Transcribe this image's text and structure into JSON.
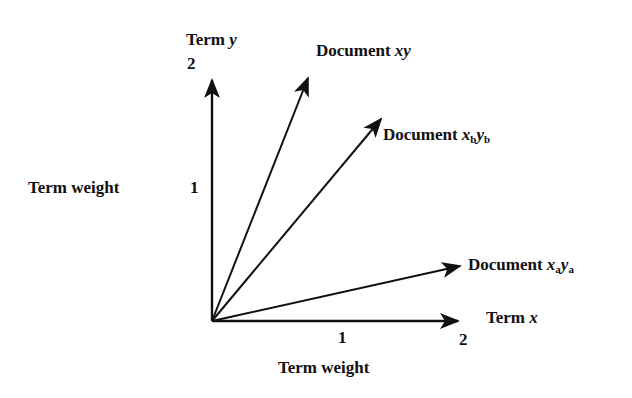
{
  "diagram": {
    "axes": {
      "y": {
        "name_prefix": "Term ",
        "name_var": "y",
        "tick_1": "1",
        "tick_2": "2",
        "label": "Term weight"
      },
      "x": {
        "name_prefix": "Term ",
        "name_var": "x",
        "tick_1": "1",
        "tick_2": "2",
        "label": "Term weight"
      }
    },
    "vectors": [
      {
        "prefix": "Document ",
        "var1": "x",
        "sub1": "",
        "var2": "y",
        "sub2": "",
        "approx_x": 0.8,
        "approx_y": 2.0
      },
      {
        "prefix": "Document ",
        "var1": "x",
        "sub1": "b",
        "var2": "y",
        "sub2": "b",
        "approx_x": 1.5,
        "approx_y": 1.6
      },
      {
        "prefix": "Document ",
        "var1": "x",
        "sub1": "a",
        "var2": "y",
        "sub2": "a",
        "approx_x": 2.0,
        "approx_y": 0.45
      }
    ],
    "colors": {
      "ink": "#111111",
      "background": "#ffffff"
    }
  }
}
